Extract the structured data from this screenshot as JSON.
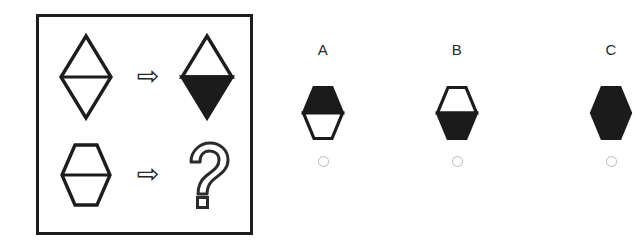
{
  "panel": {
    "name": "analogy-panel",
    "rows": [
      {
        "id": "row-1",
        "source": {
          "shape": "diamond",
          "fill": "outline",
          "divider": true,
          "label": "outlined diamond with horizontal divider"
        },
        "operator": "⇨",
        "target": {
          "shape": "diamond",
          "fill": "bottom-half-black",
          "divider": true,
          "label": "diamond with black lower half"
        }
      },
      {
        "id": "row-2",
        "source": {
          "shape": "hexagon",
          "fill": "outline",
          "divider": true,
          "label": "outlined hexagon with horizontal divider"
        },
        "operator": "⇨",
        "target": {
          "shape": "question-mark",
          "fill": "outline",
          "label": "question mark"
        }
      }
    ]
  },
  "options": [
    {
      "letter": "A",
      "shape": "hexagon",
      "fill": "top-half-black",
      "description": "hexagon with black upper half and white lower half",
      "selected": false
    },
    {
      "letter": "B",
      "shape": "hexagon",
      "fill": "bottom-half-black",
      "description": "hexagon with white upper half and black lower half",
      "selected": false
    },
    {
      "letter": "C",
      "shape": "hexagon",
      "fill": "solid-black",
      "description": "solid black hexagon, cropped at right edge",
      "selected": false
    }
  ],
  "colors": {
    "ink": "#1d1d1d",
    "fill_black": "#1b1b1b",
    "background": "#ffffff",
    "radio_border": "#b9b9b9",
    "panel_border": "#1d1d1d"
  }
}
